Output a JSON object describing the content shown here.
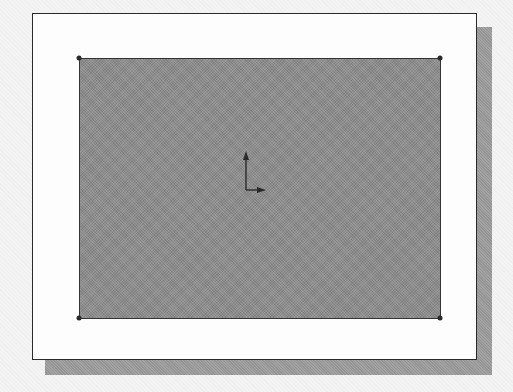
{
  "figure": {
    "colors": {
      "frame_background": "#fdfdfd",
      "frame_border": "#2a2a2a",
      "shadow": "#a2a2a2",
      "sketch_fill": "#8c8c8c",
      "sketch_border": "#333333"
    },
    "rectangle": {
      "vertices": [
        {
          "name": "top-left",
          "x": 79,
          "y": 58
        },
        {
          "name": "top-right",
          "x": 440,
          "y": 58
        },
        {
          "name": "bottom-left",
          "x": 79,
          "y": 318
        },
        {
          "name": "bottom-right",
          "x": 440,
          "y": 318
        }
      ]
    },
    "origin_icon": "coordinate-axes-icon"
  }
}
